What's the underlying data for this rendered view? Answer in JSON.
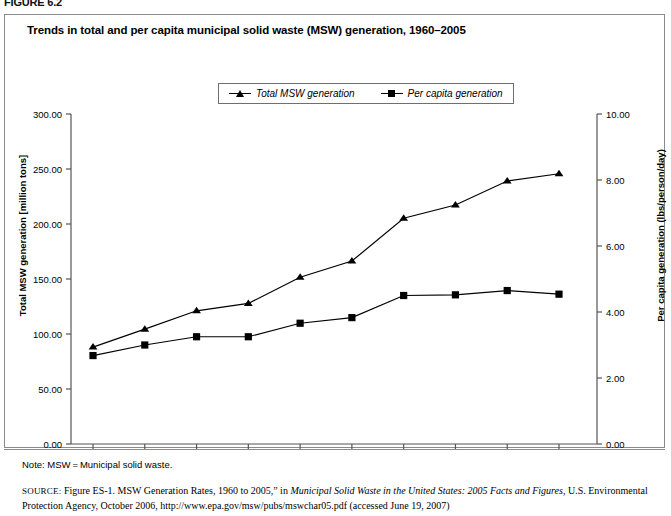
{
  "figure": {
    "label": "FIGURE 6.2",
    "title": "Trends in total and per capita municipal solid waste (MSW) generation, 1960–2005"
  },
  "legend": {
    "position": "top-center",
    "items": [
      {
        "label": "Total MSW generation",
        "marker": "triangle-marker-icon",
        "color": "#000000"
      },
      {
        "label": "Per capita generation",
        "marker": "square-marker-icon",
        "color": "#000000"
      }
    ]
  },
  "axes": {
    "x": {
      "label": "",
      "ticks": [
        "1960",
        "1965",
        "1970",
        "1975",
        "1980",
        "1985",
        "1990",
        "1995",
        "2000",
        "2005"
      ]
    },
    "y_left": {
      "label": "Total MSW generation [million tons]",
      "ticks": [
        "0.00",
        "50.00",
        "100.00",
        "150.00",
        "200.00",
        "250.00",
        "300.00"
      ],
      "min": 0,
      "max": 300
    },
    "y_right": {
      "label": "Per capita generation (lbs/person/day)",
      "ticks": [
        "0.00",
        "2.00",
        "4.00",
        "6.00",
        "8.00",
        "10.00"
      ],
      "min": 0,
      "max": 10
    }
  },
  "footer": {
    "note": "Note: MSW = Municipal solid waste.",
    "source_label": "SOURCE:",
    "source_part1": " Figure ES-1. MSW Generation Rates, 1960 to 2005,” in ",
    "source_italic": "Municipal Solid Waste in the United States: 2005 Facts and Figures",
    "source_part2": ", U.S. Environmental Protection Agency, October 2006, http://www.epa.gov/msw/pubs/mswchar05.pdf (accessed June 19, 2007)"
  },
  "chart_data": {
    "type": "line",
    "title": "Trends in total and per capita municipal solid waste (MSW) generation, 1960–2005",
    "xlabel": "",
    "ylabel": "Total MSW generation [million tons]",
    "ylabel_secondary": "Per capita generation (lbs/person/day)",
    "x": [
      1960,
      1965,
      1970,
      1975,
      1980,
      1985,
      1990,
      1995,
      2000,
      2005
    ],
    "categories": [
      "1960",
      "1965",
      "1970",
      "1975",
      "1980",
      "1985",
      "1990",
      "1995",
      "2000",
      "2005"
    ],
    "ylim": [
      0,
      300
    ],
    "ylim_secondary": [
      0,
      10
    ],
    "grid": false,
    "legend_position": "top-center",
    "series": [
      {
        "name": "Total MSW generation",
        "axis": "left",
        "units": "million tons",
        "marker": "triangle",
        "color": "#000000",
        "values": [
          88.1,
          104.4,
          121.1,
          127.8,
          151.6,
          166.3,
          205.2,
          217.3,
          239.1,
          245.7
        ]
      },
      {
        "name": "Per capita generation",
        "axis": "right",
        "units": "lbs/person/day",
        "marker": "square",
        "color": "#000000",
        "values": [
          2.68,
          3.0,
          3.25,
          3.25,
          3.66,
          3.83,
          4.5,
          4.52,
          4.65,
          4.54
        ]
      }
    ]
  }
}
